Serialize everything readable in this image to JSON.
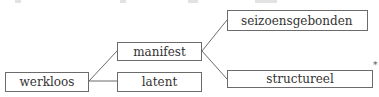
{
  "diagram": {
    "type": "tree",
    "root": {
      "id": "werkloos",
      "label": "werkloos"
    },
    "nodes": [
      {
        "id": "werkloos",
        "label": "werkloos",
        "x": 5,
        "y": 72,
        "w": 84,
        "h": 20
      },
      {
        "id": "manifest",
        "label": "manifest",
        "x": 117,
        "y": 42,
        "w": 85,
        "h": 19
      },
      {
        "id": "latent",
        "label": "latent",
        "x": 117,
        "y": 72,
        "w": 85,
        "h": 20
      },
      {
        "id": "seizoensgebonden",
        "label": "seizoensgebonden",
        "x": 227,
        "y": 10,
        "w": 141,
        "h": 21
      },
      {
        "id": "structureel",
        "label": "structureel",
        "x": 227,
        "y": 70,
        "w": 146,
        "h": 18
      }
    ],
    "edges": [
      {
        "from": "werkloos",
        "to": "manifest"
      },
      {
        "from": "werkloos",
        "to": "latent"
      },
      {
        "from": "manifest",
        "to": "seizoensgebonden"
      },
      {
        "from": "manifest",
        "to": "structureel"
      }
    ],
    "annotation": "*",
    "colors": {
      "line": "#6b6b6b",
      "text": "#333333",
      "background": "#ffffff"
    }
  }
}
